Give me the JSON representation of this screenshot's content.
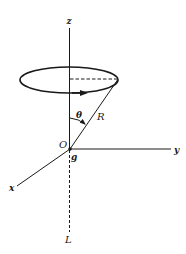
{
  "diagram": {
    "labels": {
      "z_axis": "z",
      "y_axis": "y",
      "x_axis": "x",
      "origin": "O",
      "gravity": "g",
      "radius": "R",
      "angle": "θ",
      "lower_axis": "L"
    },
    "colors": {
      "stroke": "#1a1a1a",
      "background": "#ffffff"
    }
  }
}
